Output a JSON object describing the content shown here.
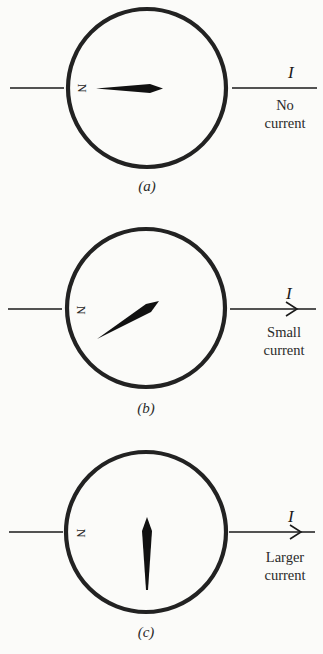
{
  "figure": {
    "colors": {
      "background": "#fbfbf9",
      "ink": "#1a1a1a"
    },
    "panels": [
      {
        "id": "a",
        "caption": "(a)",
        "north_label": "N",
        "current_symbol": "I",
        "current_desc_line1": "No",
        "current_desc_line2": "current",
        "has_arrow": false,
        "needle_direction": "pointing right (east), along wire"
      },
      {
        "id": "b",
        "caption": "(b)",
        "north_label": "N",
        "current_symbol": "I",
        "current_desc_line1": "Small",
        "current_desc_line2": "current",
        "has_arrow": true,
        "needle_direction": "deflected ~30° from wire"
      },
      {
        "id": "c",
        "caption": "(c)",
        "north_label": "N",
        "current_symbol": "I",
        "current_desc_line1": "Larger",
        "current_desc_line2": "current",
        "has_arrow": true,
        "needle_direction": "deflected ~90°, perpendicular to wire"
      }
    ]
  }
}
